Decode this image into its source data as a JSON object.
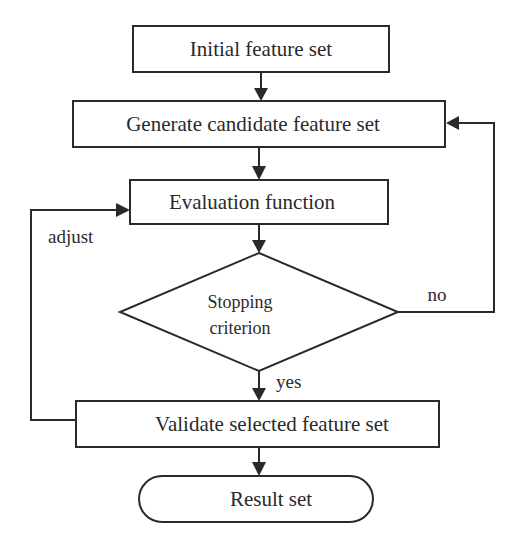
{
  "diagram": {
    "type": "flowchart",
    "nodes": {
      "initial": {
        "label": "Initial feature set",
        "shape": "rectangle"
      },
      "generate": {
        "label": "Generate candidate feature set",
        "shape": "rectangle"
      },
      "evaluation": {
        "label": "Evaluation function",
        "shape": "rectangle"
      },
      "stopping": {
        "label_line1": "Stopping",
        "label_line2": "criterion",
        "shape": "diamond"
      },
      "validate": {
        "label": "Validate selected feature set",
        "shape": "rectangle"
      },
      "result": {
        "label": "Result set",
        "shape": "terminator"
      }
    },
    "edges": {
      "no": {
        "label": "no",
        "from": "stopping",
        "to": "generate"
      },
      "yes": {
        "label": "yes",
        "from": "stopping",
        "to": "validate"
      },
      "adjust": {
        "label": "adjust",
        "from": "validate",
        "to": "evaluation"
      }
    },
    "colors": {
      "stroke": "#2a2a2a",
      "background": "#ffffff"
    }
  }
}
